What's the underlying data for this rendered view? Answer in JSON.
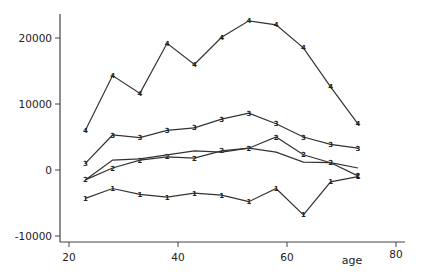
{
  "chart_data": {
    "type": "line",
    "title": "",
    "xlabel": "age",
    "ylabel": "",
    "xlim": [
      20,
      80
    ],
    "ylim": [
      -10000,
      24000
    ],
    "x_ticks": [
      20,
      40,
      60,
      80
    ],
    "x_tick_labels": [
      "20",
      "40",
      "60",
      "80"
    ],
    "y_ticks": [
      20000,
      10000,
      0,
      -10000
    ],
    "y_tick_labels": [
      "20000",
      "10000",
      "0",
      "-10000"
    ],
    "grid": false,
    "legend": "none (series identified by plot-symbol digits)",
    "x": [
      23,
      28,
      33,
      38,
      43,
      48,
      53,
      58,
      63,
      68,
      73
    ],
    "series": [
      {
        "name": "1",
        "marker": "1",
        "values": [
          -4300,
          -2800,
          -3700,
          -4100,
          -3500,
          -3800,
          -4800,
          -2800,
          -6800,
          -1800,
          -1000
        ]
      },
      {
        "name": "2",
        "marker": "2",
        "values": [
          -1500,
          300,
          1500,
          2000,
          1800,
          2900,
          3300,
          5000,
          2300,
          1100,
          -900
        ]
      },
      {
        "name": "2 (unmarked)",
        "marker": "",
        "values": [
          -1500,
          1500,
          1700,
          2300,
          2900,
          2700,
          3300,
          2700,
          1200,
          1100,
          300
        ]
      },
      {
        "name": "3",
        "marker": "3",
        "values": [
          1000,
          5300,
          4900,
          6000,
          6400,
          7700,
          8600,
          7000,
          5000,
          3900,
          3300
        ]
      },
      {
        "name": "4",
        "marker": "4",
        "values": [
          6000,
          14300,
          11600,
          19200,
          16000,
          20100,
          22600,
          22000,
          18500,
          12600,
          7000
        ]
      }
    ]
  },
  "layout": {
    "plot": {
      "x0_px": 69,
      "px_per_x": 5.45,
      "y0_px": 170,
      "px_per_y": 0.0066
    },
    "axis": {
      "left_px": 60,
      "bottom_px": 242,
      "top_px": 14,
      "right_px": 405
    },
    "colors": {
      "line": "#333333",
      "axis": "#444444",
      "text": "#222222"
    }
  }
}
